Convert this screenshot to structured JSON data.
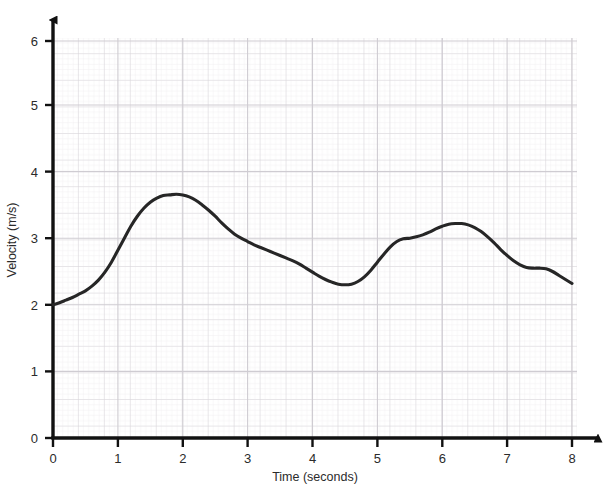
{
  "chart_data": {
    "type": "line",
    "title": "",
    "xlabel": "Time (seconds)",
    "ylabel": "Velocity (m/s)",
    "xlim": [
      0,
      8
    ],
    "ylim": [
      0,
      6
    ],
    "xticks": [
      "0",
      "1",
      "2",
      "3",
      "4",
      "5",
      "6",
      "7",
      "8"
    ],
    "yticks": [
      "0",
      "1",
      "2",
      "3",
      "4",
      "5",
      "6"
    ],
    "grid": true,
    "grid_style": "graph-paper, minor squares 0.04 units, medium lines every 0.2 units",
    "legend": "none",
    "series": [
      {
        "name": "velocity",
        "color": "#262626",
        "x": [
          0.0,
          0.1,
          0.2,
          0.3,
          0.4,
          0.5,
          0.6,
          0.7,
          0.8,
          0.9,
          1.0,
          1.1,
          1.2,
          1.3,
          1.4,
          1.5,
          1.6,
          1.7,
          1.8,
          1.9,
          2.0,
          2.1,
          2.2,
          2.3,
          2.4,
          2.5,
          2.6,
          2.7,
          2.8,
          2.9,
          3.0,
          3.1,
          3.2,
          3.3,
          3.4,
          3.5,
          3.6,
          3.7,
          3.8,
          3.9,
          4.0,
          4.1,
          4.2,
          4.3,
          4.4,
          4.5,
          4.6,
          4.7,
          4.8,
          4.9,
          5.0,
          5.1,
          5.2,
          5.3,
          5.4,
          5.5,
          5.6,
          5.7,
          5.8,
          5.9,
          6.0,
          6.1,
          6.2,
          6.3,
          6.4,
          6.5,
          6.6,
          6.7,
          6.8,
          6.9,
          7.0,
          7.1,
          7.2,
          7.3,
          7.4,
          7.5,
          7.6,
          7.7,
          7.8,
          7.9,
          8.0
        ],
        "y": [
          2.0,
          2.03,
          2.07,
          2.11,
          2.16,
          2.21,
          2.28,
          2.37,
          2.49,
          2.64,
          2.82,
          3.0,
          3.18,
          3.33,
          3.45,
          3.54,
          3.6,
          3.64,
          3.65,
          3.66,
          3.65,
          3.62,
          3.57,
          3.5,
          3.42,
          3.33,
          3.23,
          3.14,
          3.06,
          3.0,
          2.95,
          2.9,
          2.86,
          2.82,
          2.78,
          2.74,
          2.7,
          2.66,
          2.61,
          2.55,
          2.49,
          2.43,
          2.38,
          2.34,
          2.31,
          2.3,
          2.31,
          2.35,
          2.42,
          2.52,
          2.64,
          2.76,
          2.87,
          2.95,
          2.99,
          3.0,
          3.02,
          3.05,
          3.09,
          3.14,
          3.18,
          3.21,
          3.22,
          3.22,
          3.2,
          3.16,
          3.1,
          3.02,
          2.93,
          2.83,
          2.74,
          2.66,
          2.6,
          2.56,
          2.55,
          2.55,
          2.54,
          2.5,
          2.44,
          2.38,
          2.32
        ]
      }
    ],
    "annotations": {
      "start_point": "(0, 2.0)",
      "first_peak": "(2.0, 3.65)",
      "trough": "(4.5, 2.30)",
      "shoulder": "(5.5, 3.00)",
      "second_peak": "(6.25, 3.22)",
      "tail_shoulder": "(7.4, 2.55)",
      "end_point": "(8.0, 2.32)"
    }
  },
  "axes": {
    "x_title": "Time (seconds)",
    "y_title": "Velocity (m/s)",
    "x_tick_labels": [
      "0",
      "1",
      "2",
      "3",
      "4",
      "5",
      "6",
      "7",
      "8"
    ],
    "y_tick_labels": [
      "0",
      "1",
      "2",
      "3",
      "4",
      "5",
      "6"
    ]
  },
  "colors": {
    "curve": "#262626",
    "axis": "#111111",
    "grid_minor": "#e8e6e9",
    "grid_medium": "#d6d3d8",
    "background": "#ffffff",
    "text": "#2b2b2b"
  }
}
